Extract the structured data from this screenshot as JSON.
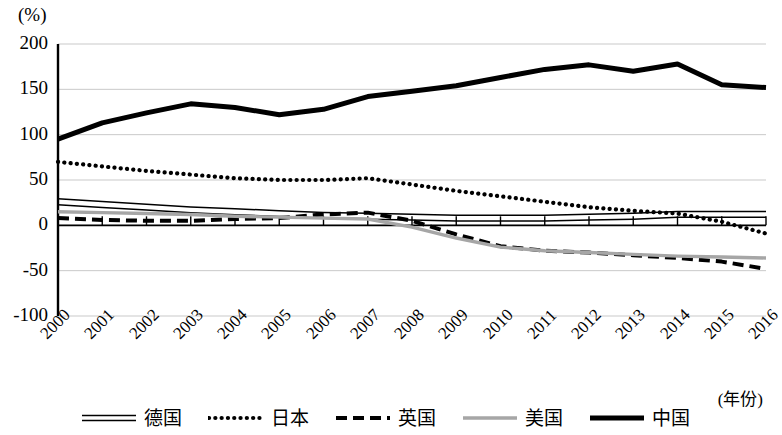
{
  "axis": {
    "unit_label": "(%)",
    "x_title": "(年份)",
    "y_ticks": [
      "200",
      "150",
      "100",
      "50",
      "0",
      "-50",
      "-100"
    ],
    "y_values": [
      200,
      150,
      100,
      50,
      0,
      -50,
      -100
    ],
    "x_ticks": [
      "2000",
      "2001",
      "2002",
      "2003",
      "2004",
      "2005",
      "2006",
      "2007",
      "2008",
      "2009",
      "2010",
      "2011",
      "2012",
      "2013",
      "2014",
      "2015",
      "2016"
    ]
  },
  "legend": {
    "items": [
      {
        "label": "德国",
        "style": "double-solid",
        "color": "#000000"
      },
      {
        "label": "日本",
        "style": "dotted",
        "color": "#000000"
      },
      {
        "label": "英国",
        "style": "dashed",
        "color": "#000000"
      },
      {
        "label": "美国",
        "style": "solid",
        "color": "#a6a6a6"
      },
      {
        "label": "中国",
        "style": "thick-solid",
        "color": "#000000"
      }
    ]
  },
  "chart_data": {
    "type": "line",
    "title": "",
    "subtitle": "",
    "xlabel": "(年份)",
    "ylabel": "(%)",
    "ylim": [
      -100,
      200
    ],
    "yticks": [
      -100,
      -50,
      0,
      50,
      100,
      150,
      200
    ],
    "grid": true,
    "legend_position": "bottom",
    "x": [
      "2000",
      "2001",
      "2002",
      "2003",
      "2004",
      "2005",
      "2006",
      "2007",
      "2008",
      "2009",
      "2010",
      "2011",
      "2012",
      "2013",
      "2014",
      "2015",
      "2016"
    ],
    "series": [
      {
        "name": "德国",
        "style": "double-solid",
        "color": "#000000",
        "values": [
          26,
          23,
          20,
          17,
          15,
          13,
          11,
          10,
          9,
          8,
          8,
          8,
          9,
          10,
          12,
          12,
          12
        ]
      },
      {
        "name": "日本",
        "style": "dotted",
        "color": "#000000",
        "values": [
          70,
          65,
          60,
          56,
          52,
          50,
          50,
          52,
          45,
          38,
          32,
          26,
          20,
          16,
          13,
          4,
          -9
        ]
      },
      {
        "name": "英国",
        "style": "dashed",
        "color": "#000000",
        "values": [
          8,
          6,
          5,
          5,
          7,
          8,
          12,
          14,
          5,
          -10,
          -23,
          -28,
          -30,
          -33,
          -36,
          -40,
          -48
        ]
      },
      {
        "name": "美国",
        "style": "solid",
        "color": "#a6a6a6",
        "values": [
          15,
          14,
          13,
          12,
          10,
          9,
          8,
          7,
          -2,
          -14,
          -24,
          -28,
          -30,
          -32,
          -34,
          -35,
          -36
        ]
      },
      {
        "name": "中国",
        "style": "thick-solid",
        "color": "#000000",
        "values": [
          95,
          113,
          124,
          134,
          130,
          122,
          128,
          142,
          148,
          154,
          163,
          172,
          177,
          170,
          178,
          155,
          152
        ]
      }
    ]
  }
}
